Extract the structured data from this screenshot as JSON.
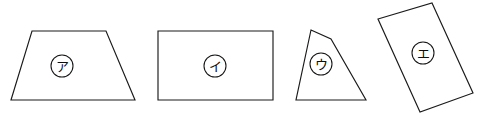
{
  "figure": {
    "background_color": "#ffffff",
    "stroke_color": "#1a1a1a",
    "width": 480,
    "height": 127,
    "shapes": [
      {
        "id": "shape-a",
        "name": "trapezoid",
        "label": "ア",
        "label_style": "circled",
        "label_x": 62,
        "label_y": 66,
        "label_radius": 11,
        "points": "32,31 106,31 135,100 11,100"
      },
      {
        "id": "shape-b",
        "name": "rectangle",
        "label": "イ",
        "label_style": "circled",
        "label_x": 215,
        "label_y": 66,
        "label_radius": 11,
        "points": "158,31 273,31 273,100 158,100"
      },
      {
        "id": "shape-c",
        "name": "irregular-quadrilateral",
        "label": "ウ",
        "label_style": "circled",
        "label_x": 321,
        "label_y": 64,
        "label_radius": 11,
        "points": "311,30 331,39 366,100 296,100"
      },
      {
        "id": "shape-d",
        "name": "tilted-rectangle",
        "label": "エ",
        "label_style": "circled",
        "label_x": 423,
        "label_y": 53,
        "label_radius": 11,
        "points": "378,19 432,3 473,93 420,112"
      }
    ]
  }
}
